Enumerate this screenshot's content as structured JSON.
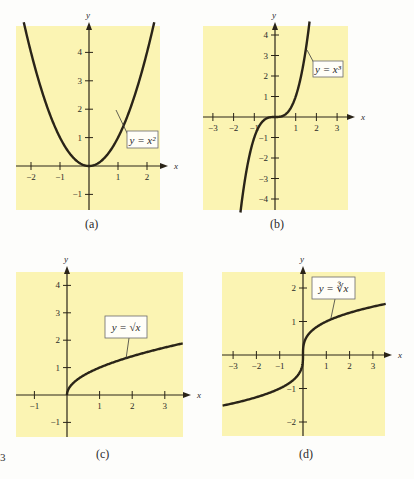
{
  "figure": {
    "edge_fragment": "3",
    "panel_bg": "#fbf4b3",
    "curve_color": "#2a2418",
    "axis_color": "#2a2418"
  },
  "chart_data": [
    {
      "type": "line",
      "id": "a",
      "caption": "(a)",
      "equation": "y = x²",
      "function": "x^2",
      "xlabel": "x",
      "ylabel": "y",
      "xlim": [
        -2.5,
        2.5
      ],
      "ylim": [
        -1.5,
        5
      ],
      "xticks": [
        -2,
        -1,
        1,
        2
      ],
      "yticks": [
        -1,
        1,
        2,
        3,
        4
      ],
      "x": [
        -2.2,
        -2,
        -1.5,
        -1,
        -0.5,
        0,
        0.5,
        1,
        1.5,
        2,
        2.2
      ],
      "y": [
        4.84,
        4,
        2.25,
        1,
        0.25,
        0,
        0.25,
        1,
        2.25,
        4,
        4.84
      ],
      "grid": false
    },
    {
      "type": "line",
      "id": "b",
      "caption": "(b)",
      "equation": "y = x³",
      "function": "x^3",
      "xlabel": "x",
      "ylabel": "y",
      "xlim": [
        -3.5,
        3.5
      ],
      "ylim": [
        -4.5,
        4.5
      ],
      "xticks": [
        -3,
        -2,
        -1,
        1,
        2,
        3
      ],
      "yticks": [
        -4,
        -3,
        -2,
        -1,
        1,
        2,
        3,
        4
      ],
      "x": [
        -1.65,
        -1.5,
        -1,
        -0.5,
        0,
        0.5,
        1,
        1.5,
        1.65
      ],
      "y": [
        -4.49,
        -3.375,
        -1,
        -0.125,
        0,
        0.125,
        1,
        3.375,
        4.49
      ],
      "grid": false
    },
    {
      "type": "line",
      "id": "c",
      "caption": "(c)",
      "equation": "y = √x",
      "function": "sqrt(x)",
      "xlabel": "x",
      "ylabel": "y",
      "xlim": [
        -1.5,
        3.6
      ],
      "ylim": [
        -1.5,
        4.5
      ],
      "xticks": [
        -1,
        1,
        2,
        3
      ],
      "yticks": [
        -1,
        1,
        2,
        3,
        4
      ],
      "x": [
        0,
        0.25,
        0.5,
        1,
        1.5,
        2,
        2.5,
        3,
        3.5
      ],
      "y": [
        0,
        0.5,
        0.707,
        1,
        1.225,
        1.414,
        1.581,
        1.732,
        1.871
      ],
      "grid": false
    },
    {
      "type": "line",
      "id": "d",
      "caption": "(d)",
      "equation": "y = ∛x",
      "function": "cbrt(x)",
      "xlabel": "x",
      "ylabel": "y",
      "xlim": [
        -3.5,
        3.6
      ],
      "ylim": [
        -2.5,
        2.5
      ],
      "xticks": [
        -3,
        -2,
        -1,
        1,
        2,
        3
      ],
      "yticks": [
        -2,
        -1,
        1,
        2
      ],
      "x": [
        -3.5,
        -3,
        -2,
        -1,
        -0.5,
        0,
        0.5,
        1,
        2,
        3,
        3.5
      ],
      "y": [
        -1.518,
        -1.442,
        -1.26,
        -1,
        -0.794,
        0,
        0.794,
        1,
        1.26,
        1.442,
        1.518
      ],
      "grid": false
    }
  ]
}
